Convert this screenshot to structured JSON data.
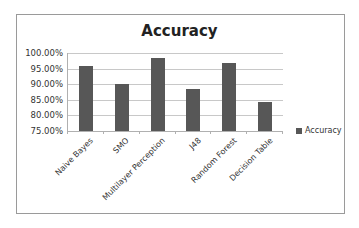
{
  "chart_data": {
    "type": "bar",
    "title": "Accuracy",
    "xlabel": "",
    "ylabel": "",
    "categories": [
      "Naive Bayes",
      "SMO",
      "Multilayer Perception",
      "J48",
      "Random Forest",
      "Decision Table"
    ],
    "series": [
      {
        "name": "Accuracy",
        "values": [
          95.7,
          90.0,
          98.5,
          88.5,
          96.8,
          84.2
        ],
        "color": "#575757"
      }
    ],
    "ylim": [
      75,
      100
    ],
    "yticks": [
      "75.00%",
      "80.00%",
      "85.00%",
      "90.00%",
      "95.00%",
      "100.00%"
    ],
    "grid": true,
    "legend_position": "right"
  },
  "legend": {
    "label": "Accuracy"
  }
}
